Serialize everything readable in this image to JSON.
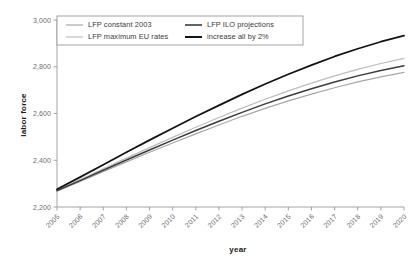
{
  "chart_data": {
    "type": "line",
    "title": "",
    "subtitle": "",
    "xlabel": "year",
    "ylabel": "labor force",
    "x": [
      2005,
      2006,
      2007,
      2008,
      2009,
      2010,
      2011,
      2012,
      2013,
      2014,
      2015,
      2016,
      2017,
      2018,
      2019,
      2020
    ],
    "categories": [
      "2005",
      "2006",
      "2007",
      "2008",
      "2009",
      "2010",
      "2011",
      "2012",
      "2013",
      "2014",
      "2015",
      "2016",
      "2017",
      "2018",
      "2019",
      "2020"
    ],
    "xlim": [
      2005,
      2020
    ],
    "ylim": [
      2200,
      3000
    ],
    "yticks": [
      2200,
      2400,
      2600,
      2800,
      3000
    ],
    "ytick_labels": [
      "2,200",
      "2,400",
      "2,600",
      "2,800",
      "3,000"
    ],
    "grid": false,
    "legend_position": "top-left-inside",
    "series": [
      {
        "name": "LFP constant 2003",
        "color": "#a8a8a8",
        "width": 1.2,
        "values": [
          2268,
          2309,
          2351,
          2393,
          2434,
          2474,
          2513,
          2551,
          2588,
          2622,
          2654,
          2683,
          2710,
          2735,
          2757,
          2776
        ]
      },
      {
        "name": "LFP maximum EU rates",
        "color": "#bdbdbd",
        "width": 1.2,
        "values": [
          2272,
          2317,
          2363,
          2409,
          2454,
          2498,
          2541,
          2583,
          2623,
          2661,
          2697,
          2730,
          2761,
          2789,
          2814,
          2836
        ]
      },
      {
        "name": "LFP ILO projections",
        "color": "#3c3c3c",
        "width": 1.5,
        "values": [
          2270,
          2313,
          2357,
          2401,
          2444,
          2486,
          2527,
          2567,
          2605,
          2641,
          2675,
          2706,
          2735,
          2761,
          2784,
          2804
        ]
      },
      {
        "name": "increase all by 2%",
        "color": "#141414",
        "width": 1.8,
        "values": [
          2276,
          2328,
          2381,
          2434,
          2486,
          2537,
          2587,
          2635,
          2682,
          2726,
          2768,
          2807,
          2844,
          2877,
          2907,
          2933
        ]
      }
    ]
  },
  "legend": {
    "items": [
      {
        "label": "LFP constant 2003",
        "color": "#a8a8a8",
        "width": 1.2
      },
      {
        "label": "LFP maximum EU rates",
        "color": "#bdbdbd",
        "width": 1.2
      },
      {
        "label": "LFP ILO projections",
        "color": "#3c3c3c",
        "width": 1.6
      },
      {
        "label": "increase all by 2%",
        "color": "#141414",
        "width": 2.0
      }
    ]
  },
  "axes": {
    "y_title": "labor force",
    "x_title": "year"
  }
}
